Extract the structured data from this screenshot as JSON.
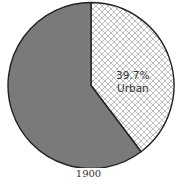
{
  "chart_data": {
    "type": "pie",
    "title": "",
    "caption": "1900",
    "slices": [
      {
        "name": "Urban",
        "value": 39.7,
        "label_line1": "39.7%",
        "label_line2": "Urban",
        "fill": "crosshatch",
        "color": "#ffffff",
        "hatch_color": "#b8b8b8"
      },
      {
        "name": "Rural",
        "value": 60.3,
        "label_line1": "",
        "label_line2": "",
        "fill": "solid",
        "color": "#7a7a7a"
      }
    ],
    "start_angle_deg": 0,
    "direction": "clockwise",
    "outline_color": "#222222"
  }
}
